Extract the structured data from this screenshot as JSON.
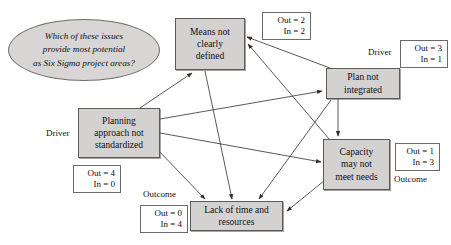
{
  "diagram": {
    "title_bubble": {
      "line1": "Which of these issues",
      "line2": "provide most potential",
      "line3": "as Six Sigma project areas?"
    },
    "nodes": [
      {
        "id": "means",
        "line1": "Means not",
        "line2": "clearly",
        "line3": "defined",
        "metric_out": "Out = 2",
        "metric_in": "In = 2",
        "role": ""
      },
      {
        "id": "plan",
        "line1": "Plan not",
        "line2": "integrated",
        "line3": "",
        "metric_out": "Out = 3",
        "metric_in": "In = 1",
        "role": "Driver"
      },
      {
        "id": "planning",
        "line1": "Planning",
        "line2": "approach not",
        "line3": "standardized",
        "metric_out": "Out = 4",
        "metric_in": "In = 0",
        "role": "Driver"
      },
      {
        "id": "capacity",
        "line1": "Capacity",
        "line2": "may not",
        "line3": "meet needs",
        "metric_out": "Out = 1",
        "metric_in": "In = 3",
        "role": "Outcome"
      },
      {
        "id": "lack",
        "line1": "Lack of time and",
        "line2": "resources",
        "line3": "",
        "metric_out": "Out = 0",
        "metric_in": "In = 4",
        "role": "Outcome"
      }
    ],
    "colors": {
      "node_fill": "#d3d2d0",
      "node_border": "#5a5a5a",
      "bubble_fill": "#d7d6d4",
      "arrow": "#3a3a3a",
      "background": "#ffffff"
    }
  }
}
